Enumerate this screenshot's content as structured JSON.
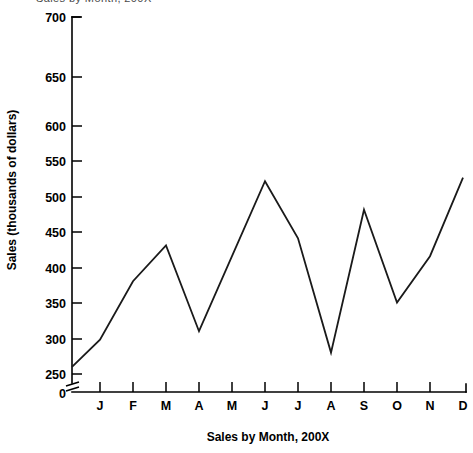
{
  "figure": {
    "cropped_header_text": "Sales by Month, 200X",
    "xlabel": "Sales by Month, 200X",
    "ylabel": "Sales (thousands of dollars)"
  },
  "chart_data": {
    "type": "line",
    "title": "",
    "subtitle": "",
    "xlabel": "Sales by Month, 200X",
    "ylabel": "Sales (thousands of dollars)",
    "categories": [
      "J",
      "F",
      "M",
      "A",
      "M",
      "J",
      "J",
      "A",
      "S",
      "O",
      "N",
      "D"
    ],
    "category_names": [
      "January",
      "February",
      "March",
      "April",
      "May",
      "June",
      "July",
      "August",
      "September",
      "October",
      "November",
      "December"
    ],
    "values": [
      248,
      330,
      380,
      260,
      365,
      470,
      390,
      230,
      430,
      300,
      365,
      475
    ],
    "origin_value": 210,
    "ylim": [
      200,
      700
    ],
    "y_ticks": [
      200,
      250,
      300,
      350,
      400,
      450,
      500,
      550,
      600,
      650,
      700
    ],
    "y_tick_labels": [
      "200",
      "250",
      "300",
      "350",
      "400",
      "450",
      "500",
      "550",
      "600",
      "650",
      "700"
    ],
    "zero_tick_label": "0",
    "axis_break": true,
    "grid": false,
    "legend": false,
    "legend_position": "none",
    "series": [
      {
        "name": "Sales",
        "values": [
          248,
          330,
          380,
          260,
          365,
          470,
          390,
          230,
          430,
          300,
          365,
          475
        ]
      }
    ],
    "line_color": "#1a1a1a"
  }
}
